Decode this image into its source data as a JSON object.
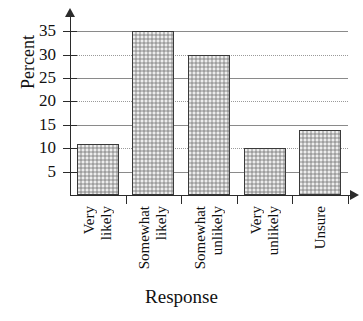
{
  "chart_data": {
    "type": "bar",
    "title": "",
    "xlabel": "Response",
    "ylabel": "Percent",
    "categories": [
      "Very likely",
      "Somewhat likely",
      "Somewhat unlikely",
      "Very unlikely",
      "Unsure"
    ],
    "category_words": [
      [
        "Very",
        "likely"
      ],
      [
        "Somewhat",
        "likely"
      ],
      [
        "Somewhat",
        "unlikely"
      ],
      [
        "Very",
        "unlikely"
      ],
      [
        "Unsure"
      ]
    ],
    "values": [
      11,
      35,
      30,
      10,
      14
    ],
    "ylim": [
      0,
      37
    ],
    "yticks": [
      5,
      10,
      15,
      20,
      25,
      30,
      35
    ],
    "ytick_labels": [
      "5",
      "10",
      "15",
      "20",
      "25",
      "30",
      "35"
    ],
    "grid": true,
    "grid_axis": "y",
    "legend": null,
    "bar_fill_color": "#bdbdbd",
    "bar_edge_color": "#3a3a3a",
    "axis_color": "#2b2b2b",
    "gridline_color": "#8a8a8a",
    "background_color": "#ffffff"
  }
}
